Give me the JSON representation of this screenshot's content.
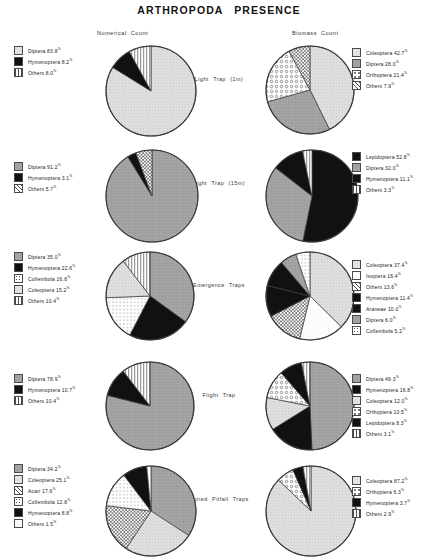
{
  "title": "ARTHROPODA   PRESENCE",
  "columns": {
    "left": "Numerical  Count",
    "right": "Biomass  Count"
  },
  "chart_data": [
    {
      "type": "pie",
      "title": "Light   Trap   (1m)",
      "panel": "Numerical  Count",
      "labels": [
        "Diptera",
        "Hymenoptera",
        "Others"
      ],
      "values": [
        83.8,
        8.2,
        8.0
      ],
      "fills": [
        "light-stipple",
        "black",
        "vertical-hatch"
      ],
      "legend": [
        "Diptera  83.8 %",
        "Hymenoptera  8.2 %",
        "Others  8.0 %"
      ]
    },
    {
      "type": "pie",
      "title": "Light   Trap   (1m)",
      "panel": "Biomass  Count",
      "labels": [
        "Coleoptera",
        "Diptera",
        "Orthoptera",
        "Others"
      ],
      "values": [
        42.7,
        28.0,
        21.4,
        7.9
      ],
      "fills": [
        "light-stipple",
        "mid-grey",
        "circles",
        "cross-hatch"
      ],
      "legend": [
        "Coleoptera 42.7 %",
        "Diptera  28.0 %",
        "Orthoptera 21.4 %",
        "Others 7.9 %"
      ]
    },
    {
      "type": "pie",
      "title": "Light   Trap   (15m)",
      "panel": "Numerical  Count",
      "labels": [
        "Diptera",
        "Hymenoptera",
        "Others"
      ],
      "values": [
        91.2,
        3.1,
        5.7
      ],
      "fills": [
        "mid-grey",
        "black",
        "cross-hatch"
      ],
      "legend": [
        "Diptera  91.2 %",
        "Hymenoptera  3.1 %",
        "Others  5.7 %"
      ]
    },
    {
      "type": "pie",
      "title": "Light   Trap   (15m)",
      "panel": "Biomass  Count",
      "labels": [
        "Lepidoptera",
        "Diptera",
        "Hymenoptera",
        "Others"
      ],
      "values": [
        52.8,
        32.0,
        11.1,
        3.3
      ],
      "fills": [
        "black",
        "mid-grey",
        "black",
        "vertical-hatch"
      ],
      "legend": [
        "Lepidoptera  52.8 %",
        "Diptera  32.0 %",
        "Hymenoptera 11.1 %",
        "Others 3.3 %"
      ]
    },
    {
      "type": "pie",
      "title": "Emergence  Traps",
      "panel": "Numerical  Count",
      "labels": [
        "Diptera",
        "Hymenoptera",
        "Collembola",
        "Coleoptera",
        "Others"
      ],
      "values": [
        35.0,
        22.6,
        16.8,
        15.2,
        10.4
      ],
      "fills": [
        "mid-grey",
        "black",
        "dots",
        "light-stipple",
        "vertical-hatch"
      ],
      "legend": [
        "Diptera  35.0 %",
        "Hymenoptera  22.6 %",
        "Collembola  16.8 %",
        "Coleoptera  15.2 %",
        "Others  10.4 %"
      ]
    },
    {
      "type": "pie",
      "title": "Emergence  Traps",
      "panel": "Biomass  Count",
      "labels": [
        "Coleoptera",
        "Isoptera",
        "Others",
        "Hymenoptera",
        "Araneae",
        "Diptera",
        "Collembola"
      ],
      "values": [
        37.4,
        16.4,
        13.6,
        11.4,
        10.0,
        6.0,
        5.2
      ],
      "fills": [
        "light-stipple",
        "white",
        "cross-hatch",
        "black",
        "black",
        "mid-grey",
        "dots"
      ],
      "legend": [
        "Coleoptera 37.4 %",
        "Isoptera 16.4 %",
        "Others  13.6 %",
        "Hymenoptera 11.4 %",
        "Araneae  10.0 %",
        "Diptera   6.0 %",
        "Collembola  5.2 %"
      ]
    },
    {
      "type": "pie",
      "title": "Flight   Trap",
      "panel": "Numerical  Count",
      "labels": [
        "Diptera",
        "Hymenoptera",
        "Others"
      ],
      "values": [
        78.9,
        10.7,
        10.4
      ],
      "fills": [
        "mid-grey",
        "black",
        "vertical-hatch"
      ],
      "legend": [
        "Diptera  78.9 %",
        "Hymenoptera  10.7 %",
        "Others   10.4 %"
      ]
    },
    {
      "type": "pie",
      "title": "Flight   Trap",
      "panel": "Biomass  Count",
      "labels": [
        "Diptera",
        "Hymenoptera",
        "Coleoptera",
        "Orthoptera",
        "Lepidoptera",
        "Others"
      ],
      "values": [
        49.3,
        16.8,
        12.0,
        10.5,
        8.3,
        3.1
      ],
      "fills": [
        "mid-grey",
        "black",
        "light-stipple",
        "circles",
        "black",
        "vertical-hatch"
      ],
      "legend": [
        "Diptera  49.3 %",
        "Hymenoptera 16.8 %",
        "Coleoptera 12.0 %",
        "Orthoptera 10.5 %",
        "Lepidoptera  8.3 %",
        "Others   3.1 %"
      ]
    },
    {
      "type": "pie",
      "title": "Buried  Pitfall  Traps",
      "panel": "Numerical  Count",
      "labels": [
        "Diptera",
        "Coleoptera",
        "Acari",
        "Collembola",
        "Hymenoptera",
        "Others"
      ],
      "values": [
        34.2,
        25.1,
        17.6,
        12.8,
        8.8,
        1.5
      ],
      "fills": [
        "mid-grey",
        "light-stipple",
        "cross-hatch",
        "dots",
        "black",
        "white"
      ],
      "legend": [
        "Diptera  34.2 %",
        "Coleoptera  25.1 %",
        "Acari  17.6 %",
        "Collembola  12.8 %",
        "Hymenoptera  8.8 %",
        "Others   1.5 %"
      ]
    },
    {
      "type": "pie",
      "title": "Buried  Pitfall  Traps",
      "panel": "Biomass  Count",
      "labels": [
        "Coleoptera",
        "Orthoptera",
        "Hymenoptera",
        "Others"
      ],
      "values": [
        87.2,
        6.3,
        3.7,
        2.9
      ],
      "fills": [
        "light-stipple",
        "circles",
        "black",
        "vertical-hatch"
      ],
      "legend": [
        "Coleoptera 87.2 %",
        "Orthoptera  6.3 %",
        "Hymenoptera 3.7 %",
        "Others 2.9 %"
      ]
    }
  ],
  "rows": [
    {
      "title": "Light   Trap   (1m)"
    },
    {
      "title": "Light   Trap   (15m)"
    },
    {
      "title": "Emergence  Traps"
    },
    {
      "title": "Flight   Trap"
    },
    {
      "title": "Buried  Pitfall  Traps"
    }
  ],
  "colors": {
    "ink": "#3a3a3a",
    "black": "#101010",
    "mid_grey": "#9d9d9d",
    "light_stipple": "#d8d8d8",
    "white": "#fdfdfd"
  }
}
